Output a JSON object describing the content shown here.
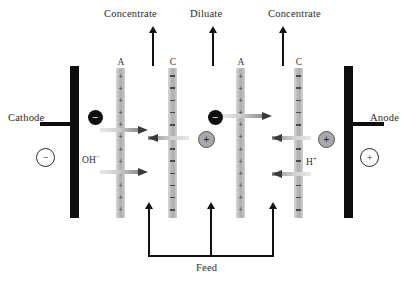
{
  "diagram": {
    "electrodes": [
      {
        "name": "cathode",
        "label": "Cathode",
        "polarity": "−",
        "x": 70,
        "side": "left"
      },
      {
        "name": "anode",
        "label": "Anode",
        "polarity": "+",
        "x": 344,
        "side": "right"
      }
    ],
    "membranes": [
      {
        "id": "a1",
        "label": "A",
        "type": "anion",
        "charge": "+",
        "x": 116
      },
      {
        "id": "c1",
        "label": "C",
        "type": "cation",
        "charge": "−",
        "x": 168
      },
      {
        "id": "a2",
        "label": "A",
        "type": "anion",
        "charge": "+",
        "x": 236
      },
      {
        "id": "c2",
        "label": "C",
        "type": "cation",
        "charge": "−",
        "x": 294
      }
    ],
    "outlets": [
      {
        "id": "out1",
        "label": "Concentrate",
        "x": 152
      },
      {
        "id": "out2",
        "label": "Diluate",
        "x": 212
      },
      {
        "id": "out3",
        "label": "Concentrate",
        "x": 282
      }
    ],
    "feed": {
      "label": "Feed",
      "inlets_x": [
        148,
        210,
        272
      ]
    },
    "ions": [
      {
        "id": "ion-neg-1",
        "sign": "−",
        "charge": "negative",
        "x": 88,
        "y": 112
      },
      {
        "id": "ion-pos-1",
        "sign": "+",
        "charge": "positive",
        "x": 198,
        "y": 134
      },
      {
        "id": "ion-neg-2",
        "sign": "−",
        "charge": "negative",
        "x": 208,
        "y": 112
      },
      {
        "id": "ion-pos-2",
        "sign": "+",
        "charge": "positive",
        "x": 318,
        "y": 134
      }
    ],
    "species": [
      {
        "id": "hydroxide",
        "label": "OH",
        "superscript": "−",
        "x": 82,
        "y": 158
      },
      {
        "id": "hydrogen",
        "label": "H",
        "superscript": "+",
        "x": 304,
        "y": 160
      }
    ],
    "colors": {
      "electrode": "#0d0d0d",
      "membrane_gray": "#b7b7b7",
      "ion_negative": "#0d0d0d",
      "ion_positive": "#a8a8a8",
      "arrow_head": "#3a3a3a",
      "background": "#ffffff"
    }
  }
}
